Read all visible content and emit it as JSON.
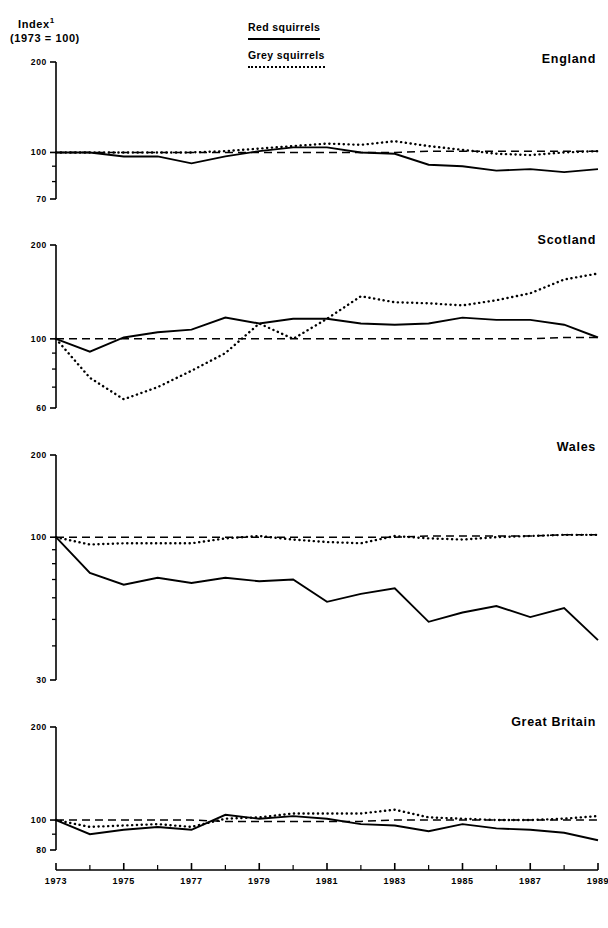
{
  "axis_title": {
    "line1": "Index",
    "superscript": "1",
    "line2": "(1973 = 100)"
  },
  "legend": {
    "red_label": "Red squirrels",
    "grey_label": "Grey squirrels"
  },
  "panels": [
    {
      "title": "England"
    },
    {
      "title": "Scotland"
    },
    {
      "title": "Wales"
    },
    {
      "title": "Great Britain"
    }
  ],
  "xticks": [
    "1973",
    "1975",
    "1977",
    "1979",
    "1981",
    "1983",
    "1985",
    "1987",
    "1989"
  ],
  "chart_data": [
    {
      "type": "line",
      "title": "England",
      "xlabel": "",
      "ylabel": "Index (1973 = 100)",
      "x": [
        1973,
        1974,
        1975,
        1976,
        1977,
        1978,
        1979,
        1980,
        1981,
        1982,
        1983,
        1984,
        1985,
        1986,
        1987,
        1988,
        1989
      ],
      "yscale": "log",
      "ylim": [
        70,
        200
      ],
      "yticks": [
        200,
        100,
        70
      ],
      "ytick_labels": [
        "200",
        "100",
        "70"
      ],
      "grid": false,
      "legend_position": "top-center",
      "series": [
        {
          "name": "Red squirrels",
          "style": "solid",
          "values": [
            100,
            100,
            97,
            97,
            92,
            97,
            101,
            104,
            104,
            100,
            99,
            91,
            90,
            87,
            88,
            86,
            88
          ]
        },
        {
          "name": "Grey squirrels",
          "style": "dotted",
          "values": [
            100,
            100,
            100,
            100,
            100,
            101,
            103,
            105,
            107,
            106,
            109,
            105,
            102,
            99,
            98,
            100,
            101
          ]
        },
        {
          "name": "Reference (1973 = 100)",
          "style": "dashed",
          "values": [
            100,
            100,
            100,
            100,
            100,
            100,
            100,
            100,
            100,
            100,
            100,
            101,
            101,
            101,
            101,
            101,
            101
          ]
        }
      ]
    },
    {
      "type": "line",
      "title": "Scotland",
      "xlabel": "",
      "ylabel": "Index (1973 = 100)",
      "x": [
        1973,
        1974,
        1975,
        1976,
        1977,
        1978,
        1979,
        1980,
        1981,
        1982,
        1983,
        1984,
        1985,
        1986,
        1987,
        1988,
        1989
      ],
      "yscale": "log",
      "ylim": [
        60,
        200
      ],
      "yticks": [
        200,
        100,
        60
      ],
      "ytick_labels": [
        "200",
        "100",
        "60"
      ],
      "grid": false,
      "legend_position": "top-center",
      "series": [
        {
          "name": "Red squirrels",
          "style": "solid",
          "values": [
            100,
            91,
            101,
            105,
            107,
            117,
            112,
            116,
            116,
            112,
            111,
            112,
            117,
            115,
            115,
            111,
            101
          ]
        },
        {
          "name": "Grey squirrels",
          "style": "dotted",
          "values": [
            100,
            75,
            64,
            70,
            79,
            90,
            112,
            100,
            116,
            137,
            131,
            130,
            128,
            133,
            140,
            155,
            162
          ]
        },
        {
          "name": "Reference (1973 = 100)",
          "style": "dashed",
          "values": [
            100,
            100,
            100,
            100,
            100,
            100,
            100,
            100,
            100,
            100,
            100,
            100,
            100,
            100,
            100,
            101,
            101
          ]
        }
      ]
    },
    {
      "type": "line",
      "title": "Wales",
      "xlabel": "",
      "ylabel": "Index (1973 = 100)",
      "x": [
        1973,
        1974,
        1975,
        1976,
        1977,
        1978,
        1979,
        1980,
        1981,
        1982,
        1983,
        1984,
        1985,
        1986,
        1987,
        1988,
        1989
      ],
      "yscale": "log",
      "ylim": [
        30,
        200
      ],
      "yticks": [
        200,
        100,
        30
      ],
      "ytick_labels": [
        "200",
        "100",
        "30"
      ],
      "grid": false,
      "legend_position": "top-center",
      "series": [
        {
          "name": "Red squirrels",
          "style": "solid",
          "values": [
            100,
            74,
            67,
            71,
            68,
            71,
            69,
            70,
            58,
            62,
            65,
            49,
            53,
            56,
            51,
            55,
            42
          ]
        },
        {
          "name": "Grey squirrels",
          "style": "dotted",
          "values": [
            100,
            94,
            95,
            95,
            95,
            99,
            101,
            98,
            96,
            95,
            101,
            99,
            98,
            100,
            101,
            102,
            102
          ]
        },
        {
          "name": "Reference (1973 = 100)",
          "style": "dashed",
          "values": [
            100,
            100,
            100,
            100,
            100,
            100,
            100,
            100,
            100,
            100,
            100,
            101,
            101,
            101,
            101,
            102,
            102
          ]
        }
      ]
    },
    {
      "type": "line",
      "title": "Great Britain",
      "xlabel": "",
      "ylabel": "Index (1973 = 100)",
      "x": [
        1973,
        1974,
        1975,
        1976,
        1977,
        1978,
        1979,
        1980,
        1981,
        1982,
        1983,
        1984,
        1985,
        1986,
        1987,
        1988,
        1989
      ],
      "yscale": "log",
      "ylim": [
        80,
        200
      ],
      "yticks": [
        200,
        100,
        80
      ],
      "ytick_labels": [
        "200",
        "100",
        "80"
      ],
      "grid": false,
      "legend_position": "top-center",
      "series": [
        {
          "name": "Red squirrels",
          "style": "solid",
          "values": [
            100,
            90,
            93,
            95,
            93,
            104,
            101,
            103,
            101,
            97,
            96,
            92,
            97,
            94,
            93,
            91,
            86
          ]
        },
        {
          "name": "Grey squirrels",
          "style": "dotted",
          "values": [
            100,
            95,
            96,
            97,
            95,
            101,
            102,
            105,
            105,
            105,
            108,
            102,
            101,
            100,
            100,
            101,
            103
          ]
        },
        {
          "name": "Reference (1973 = 100)",
          "style": "dashed",
          "values": [
            100,
            100,
            100,
            100,
            100,
            99,
            99,
            99,
            99,
            99,
            100,
            100,
            100,
            100,
            100,
            100,
            100
          ]
        }
      ]
    }
  ]
}
